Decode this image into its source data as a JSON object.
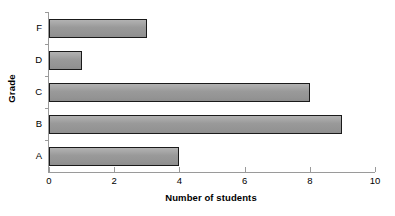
{
  "chart_data": {
    "type": "bar",
    "orientation": "horizontal",
    "title": "",
    "xlabel": "Number of students",
    "ylabel": "Grade",
    "categories": [
      "A",
      "B",
      "C",
      "D",
      "F"
    ],
    "values": [
      4,
      9,
      8,
      1,
      3
    ],
    "series": [
      {
        "name": "Number of students",
        "values": [
          4,
          9,
          8,
          1,
          3
        ]
      }
    ],
    "xlim": [
      0,
      10
    ],
    "xticks": [
      0,
      2,
      4,
      6,
      8,
      10
    ],
    "xtick_labels": [
      "0",
      "2",
      "4",
      "6",
      "8",
      "10"
    ],
    "category_order_bottom_to_top": [
      "A",
      "B",
      "C",
      "D",
      "F"
    ],
    "grid": false,
    "legend": false,
    "bar_fill_color": "#999999",
    "bar_border_color": "#1a1a1a",
    "axis_color": "#9a9a9a",
    "background_color": "#ffffff"
  }
}
